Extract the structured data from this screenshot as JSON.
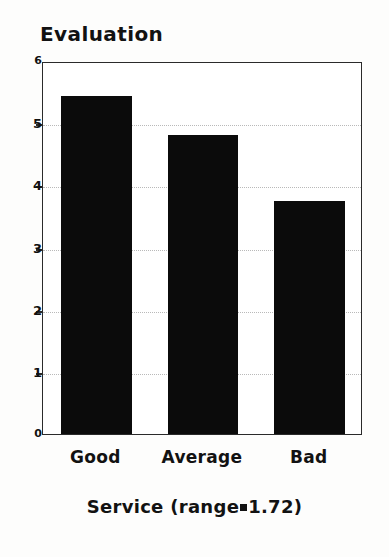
{
  "chart_data": {
    "type": "bar",
    "title": "Evaluation",
    "xlabel": "Service (range=1.72)",
    "ylabel": "",
    "categories": [
      "Good",
      "Average",
      "Bad"
    ],
    "values": [
      5.44,
      4.81,
      3.75
    ],
    "ylim": [
      0,
      6
    ],
    "yticks": [
      0,
      1,
      2,
      3,
      4,
      5,
      6
    ],
    "ytick_labels": [
      "0",
      "1",
      "2",
      "3",
      "4",
      "5",
      "6"
    ],
    "grid": true,
    "grid_axis": "y",
    "legend": null,
    "bar_color": "#0b0b0b",
    "frame_color": "#2a2a2a",
    "grid_color": "#b9b9b9",
    "background": "#ffffff"
  },
  "axis_title": {
    "prefix": "Service (range",
    "separator": "=",
    "suffix": "1.72)"
  }
}
